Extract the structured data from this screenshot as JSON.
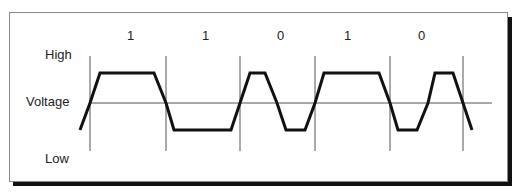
{
  "diagram": {
    "type": "digital-signal-waveform",
    "y_labels": {
      "high": "High",
      "mid": "Voltage",
      "low": "Low"
    },
    "bits": [
      {
        "label": "1",
        "x": 130
      },
      {
        "label": "1",
        "x": 205
      },
      {
        "label": "0",
        "x": 280
      },
      {
        "label": "1",
        "x": 347
      },
      {
        "label": "0",
        "x": 421
      }
    ],
    "bit_boundaries_x": [
      90,
      166,
      240,
      315,
      390,
      463
    ],
    "levels": {
      "high_y": 73,
      "mid_y": 103,
      "low_y": 130
    },
    "waveform_points": "80,130 90,103 100,73 154,73 166,103 174,130 231,130 240,103 250,73 265,73 277,103 286,130 305,130 315,103 324,73 379,73 390,103 398,130 417,130 428,103 435,73 453,73 463,103 472,130",
    "colors": {
      "waveform": "#111111",
      "gridline": "#555555",
      "frame": "#888888",
      "shadow": "#111111",
      "text": "#222222"
    }
  }
}
